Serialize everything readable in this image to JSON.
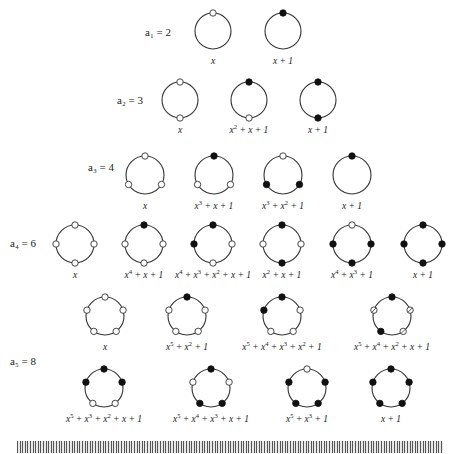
{
  "figure": {
    "type": "necklace-diagram",
    "node_legend": {
      "open": "0",
      "filled": "1",
      "hatched": "alternate/marked"
    },
    "rows": [
      {
        "label": "a₁ = 2",
        "label_pos": [
          145,
          36
        ],
        "n": 1,
        "cy": 31,
        "r": 18,
        "necklaces": [
          {
            "cx": 213,
            "nodes": [
              "open"
            ],
            "poly": "x",
            "poly_html": "x"
          },
          {
            "cx": 283,
            "nodes": [
              "filled"
            ],
            "poly": "x + 1",
            "poly_html": "x + 1"
          }
        ]
      },
      {
        "label": "a₂ = 3",
        "label_pos": [
          117,
          104
        ],
        "n": 2,
        "cy": 100,
        "r": 18,
        "necklaces": [
          {
            "cx": 180,
            "nodes": [
              "open",
              "open"
            ],
            "poly": "x",
            "poly_html": "x"
          },
          {
            "cx": 249,
            "nodes": [
              "filled",
              "open"
            ],
            "poly": "x^2 + x + 1",
            "poly_html": "x<tspan class='up' dy='-4'>2</tspan><tspan dy='4'> + x + 1</tspan>"
          },
          {
            "cx": 318,
            "nodes": [
              "filled",
              "filled"
            ],
            "poly": "x + 1",
            "poly_html": "x + 1"
          }
        ]
      },
      {
        "label": "a₃ = 4",
        "label_pos": [
          88,
          171
        ],
        "n": 3,
        "cy": 175,
        "r": 19,
        "necklaces": [
          {
            "cx": 145,
            "nodes": [
              "open",
              "open",
              "open"
            ],
            "poly": "x",
            "poly_html": "x"
          },
          {
            "cx": 214,
            "nodes": [
              "filled",
              "open",
              "open"
            ],
            "poly": "x^3 + x + 1",
            "poly_html": "x<tspan class='up' dy='-4'>3</tspan><tspan dy='4'> + x + 1</tspan>"
          },
          {
            "cx": 283,
            "nodes": [
              "open",
              "filled",
              "filled"
            ],
            "poly": "x^3 + x^2 + 1",
            "poly_html": "x<tspan class='up' dy='-4'>3</tspan><tspan dy='4'> + x</tspan><tspan class='up' dy='-4'>2</tspan><tspan dy='4'> + 1</tspan>"
          },
          {
            "cx": 352,
            "nodes": [
              "filled"
            ],
            "poly": "x + 1",
            "poly_html": "x + 1"
          }
        ]
      },
      {
        "label": "a₄ = 6",
        "label_pos": [
          10,
          247
        ],
        "n": 4,
        "cy": 244,
        "r": 19,
        "necklaces": [
          {
            "cx": 75,
            "nodes": [
              "open",
              "open",
              "open",
              "open"
            ],
            "poly": "x",
            "poly_html": "x"
          },
          {
            "cx": 144,
            "nodes": [
              "filled",
              "open",
              "open",
              "open"
            ],
            "poly": "x^4 + x + 1",
            "poly_html": "x<tspan class='up' dy='-4'>4</tspan><tspan dy='4'> + x + 1</tspan>"
          },
          {
            "cx": 213,
            "nodes": [
              "filled",
              "open",
              "open",
              "filled"
            ],
            "poly": "x^4 + x^3 + x^2 + x + 1",
            "poly_html": "x<tspan class='up' dy='-4'>4</tspan><tspan dy='4'> + x</tspan><tspan class='up' dy='-4'>3</tspan><tspan dy='4'> + x</tspan><tspan class='up' dy='-4'>2</tspan><tspan dy='4'> + x + 1</tspan>"
          },
          {
            "cx": 282,
            "nodes": [
              "filled",
              "open",
              "filled",
              "open"
            ],
            "poly": "x^2 + x + 1",
            "poly_html": "x<tspan class='up' dy='-4'>2</tspan><tspan dy='4'> + x + 1</tspan>"
          },
          {
            "cx": 352,
            "nodes": [
              "open",
              "filled",
              "filled",
              "filled"
            ],
            "poly": "x^4 + x^3 + 1",
            "poly_html": "x<tspan class='up' dy='-4'>4</tspan><tspan dy='4'> + x</tspan><tspan class='up' dy='-4'>3</tspan><tspan dy='4'> + 1</tspan>"
          },
          {
            "cx": 423,
            "nodes": [
              "filled",
              "filled",
              "filled",
              "filled"
            ],
            "poly": "x + 1",
            "poly_html": "x + 1"
          }
        ]
      },
      {
        "label": "a₅ = 8",
        "label_pos": [
          10,
          365
        ],
        "n": 5,
        "cy": 316,
        "r": 19,
        "necklaces": [
          {
            "cx": 105,
            "nodes": [
              "open",
              "open",
              "open",
              "open",
              "open"
            ],
            "poly": "x",
            "poly_html": "x"
          },
          {
            "cx": 187,
            "nodes": [
              "filled",
              "open",
              "open",
              "open",
              "open"
            ],
            "poly": "x^5 + x^2 + 1",
            "poly_html": "x<tspan class='up' dy='-4'>5</tspan><tspan dy='4'> + x</tspan><tspan class='up' dy='-4'>2</tspan><tspan dy='4'> + 1</tspan>"
          },
          {
            "cx": 282,
            "nodes": [
              "filled",
              "open",
              "open",
              "open",
              "filled"
            ],
            "poly": "x^5 + x^4 + x^3 + x^2 + 1",
            "poly_html": "x<tspan class='up' dy='-4'>5</tspan><tspan dy='4'> + x</tspan><tspan class='up' dy='-4'>4</tspan><tspan dy='4'> + x</tspan><tspan class='up' dy='-4'>3</tspan><tspan dy='4'> + x</tspan><tspan class='up' dy='-4'>2</tspan><tspan dy='4'> + 1</tspan>"
          },
          {
            "cx": 392,
            "nodes": [
              "filled",
              "hatch",
              "hatch",
              "filled",
              "hatch"
            ],
            "poly": "x^5 + x^4 + x^2 + x + 1",
            "poly_html": "x<tspan class='up' dy='-4'>5</tspan><tspan dy='4'> + x</tspan><tspan class='up' dy='-4'>4</tspan><tspan dy='4'> + x</tspan><tspan class='up' dy='-4'>2</tspan><tspan dy='4'> + x + 1</tspan>"
          }
        ]
      },
      {
        "label": "",
        "label_pos": [
          0,
          0
        ],
        "n": 5,
        "cy": 388,
        "r": 19,
        "necklaces": [
          {
            "cx": 104,
            "nodes": [
              "filled",
              "filled",
              "open",
              "open",
              "filled"
            ],
            "poly": "x^5 + x^3 + x^2 + x + 1",
            "poly_html": "x<tspan class='up' dy='-4'>5</tspan><tspan dy='4'> + x</tspan><tspan class='up' dy='-4'>3</tspan><tspan dy='4'> + x</tspan><tspan class='up' dy='-4'>2</tspan><tspan dy='4'> + x + 1</tspan>"
          },
          {
            "cx": 211,
            "nodes": [
              "filled",
              "open",
              "filled",
              "filled",
              "open"
            ],
            "poly": "x^5 + x^4 + x^3 + x + 1",
            "poly_html": "x<tspan class='up' dy='-4'>5</tspan><tspan dy='4'> + x</tspan><tspan class='up' dy='-4'>4</tspan><tspan dy='4'> + x</tspan><tspan class='up' dy='-4'>3</tspan><tspan dy='4'> + x + 1</tspan>"
          },
          {
            "cx": 307,
            "nodes": [
              "open",
              "filled",
              "filled",
              "filled",
              "filled"
            ],
            "poly": "x^5 + x^3 + 1",
            "poly_html": "x<tspan class='up' dy='-4'>5</tspan><tspan dy='4'> + x</tspan><tspan class='up' dy='-4'>3</tspan><tspan dy='4'> + 1</tspan>"
          },
          {
            "cx": 391,
            "nodes": [
              "filled",
              "filled",
              "filled",
              "filled",
              "filled"
            ],
            "poly": "x + 1",
            "poly_html": "x + 1"
          }
        ]
      }
    ],
    "footer": {
      "barcode": "decorative-barcode-strip"
    }
  }
}
